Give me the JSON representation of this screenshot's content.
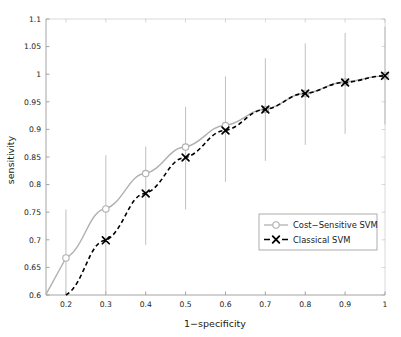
{
  "chart_data": {
    "type": "line",
    "title": "",
    "subtitle": "",
    "xlabel": "1−specificity",
    "ylabel": "sensitivity",
    "xlim": [
      0.15,
      1.0
    ],
    "ylim": [
      0.6,
      1.1
    ],
    "xticks": [
      0.2,
      0.3,
      0.4,
      0.5,
      0.6,
      0.7,
      0.8,
      0.9,
      1
    ],
    "xticklabels": [
      "0.2",
      "0.3",
      "0.4",
      "0.5",
      "0.6",
      "0.7",
      "0.8",
      "0.9",
      "1"
    ],
    "yticks": [
      0.6,
      0.65,
      0.7,
      0.75,
      0.8,
      0.85,
      0.9,
      0.95,
      1,
      1.05,
      1.1
    ],
    "yticklabels": [
      "0.6",
      "0.65",
      "0.7",
      "0.75",
      "0.8",
      "0.85",
      "0.9",
      "0.95",
      "1",
      "1.05",
      "1.1"
    ],
    "grid": false,
    "legend_position": "lower right",
    "x": [
      0.2,
      0.3,
      0.4,
      0.5,
      0.6,
      0.7,
      0.8,
      0.9,
      1.0
    ],
    "series": [
      {
        "name": "Cost−Sensitive SVM",
        "color": "#b0b0b0",
        "linestyle": "solid",
        "marker": "circle",
        "values": [
          0.667,
          0.756,
          0.82,
          0.868,
          0.907,
          0.936,
          0.965,
          0.986,
          0.997
        ],
        "errorbar_low": [
          0.6,
          0.604,
          0.691,
          0.755,
          0.805,
          0.843,
          0.872,
          0.892,
          0.909
        ],
        "errorbar_high": [
          0.755,
          0.853,
          0.869,
          0.941,
          0.996,
          1.029,
          1.056,
          1.075,
          1.086
        ]
      },
      {
        "name": "Classical SVM",
        "color": "#000000",
        "linestyle": "dashed",
        "marker": "x",
        "values": [
          0.6,
          0.699,
          0.784,
          0.849,
          0.898,
          0.936,
          0.965,
          0.985,
          0.997
        ],
        "errorbar_low": [
          null,
          null,
          null,
          null,
          null,
          null,
          null,
          null,
          null
        ],
        "errorbar_high": [
          null,
          null,
          null,
          null,
          null,
          null,
          null,
          null,
          null
        ]
      }
    ]
  },
  "legend": {
    "entries": [
      {
        "label": "Cost−Sensitive SVM",
        "marker": "circle-marker",
        "color": "#b0b0b0"
      },
      {
        "label": "Classical SVM",
        "marker": "x-marker",
        "color": "#000000"
      }
    ]
  },
  "colors": {
    "cost_sensitive": "#b0b0b0",
    "classical": "#000000",
    "axis": "#9a9a9a",
    "background": "#ffffff"
  }
}
